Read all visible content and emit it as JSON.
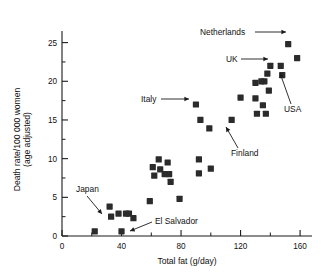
{
  "chart_data": {
    "type": "scatter",
    "title": "",
    "xlabel": "Total fat (g/day)",
    "ylabel_line1": "Death rate/100 000 women",
    "ylabel_line2": "(age adjusted)",
    "xlim": [
      0,
      168
    ],
    "ylim": [
      0,
      26.5
    ],
    "grid": false,
    "legend": "none",
    "xticks_major": [
      0,
      40,
      80,
      120,
      160
    ],
    "xticks_major_labels": [
      "0",
      "40",
      "80",
      "120",
      "160"
    ],
    "xticks_minor": [
      20,
      60,
      100,
      140
    ],
    "yticks_major": [
      0,
      5,
      10,
      15,
      20,
      25
    ],
    "yticks_major_labels": [
      "0",
      "5",
      "10",
      "15",
      "20",
      "25"
    ],
    "yticks_minor": [
      2.5,
      7.5,
      12.5,
      17.5,
      22.5
    ],
    "marker_shape": "square",
    "marker_color": "#2b2b2b",
    "points": [
      {
        "x": 22,
        "y": 0.6,
        "label": ""
      },
      {
        "x": 32,
        "y": 3.8,
        "label": ""
      },
      {
        "x": 33,
        "y": 2.5,
        "label": "Japan"
      },
      {
        "x": 38,
        "y": 2.9,
        "label": ""
      },
      {
        "x": 40,
        "y": 0.6,
        "label": "El Salvador"
      },
      {
        "x": 43,
        "y": 2.9,
        "label": ""
      },
      {
        "x": 45,
        "y": 2.9,
        "label": ""
      },
      {
        "x": 48,
        "y": 2.3,
        "label": ""
      },
      {
        "x": 59,
        "y": 4.5,
        "label": ""
      },
      {
        "x": 61,
        "y": 8.9,
        "label": ""
      },
      {
        "x": 62,
        "y": 7.8,
        "label": ""
      },
      {
        "x": 65,
        "y": 9.9,
        "label": ""
      },
      {
        "x": 66,
        "y": 8.6,
        "label": ""
      },
      {
        "x": 69,
        "y": 8.0,
        "label": ""
      },
      {
        "x": 71,
        "y": 9.5,
        "label": ""
      },
      {
        "x": 72,
        "y": 8.0,
        "label": ""
      },
      {
        "x": 73,
        "y": 7.0,
        "label": ""
      },
      {
        "x": 79,
        "y": 4.8,
        "label": ""
      },
      {
        "x": 90,
        "y": 17.0,
        "label": "Italy"
      },
      {
        "x": 92,
        "y": 9.9,
        "label": ""
      },
      {
        "x": 92,
        "y": 8.1,
        "label": ""
      },
      {
        "x": 93,
        "y": 15.0,
        "label": ""
      },
      {
        "x": 99,
        "y": 13.9,
        "label": ""
      },
      {
        "x": 100,
        "y": 8.7,
        "label": ""
      },
      {
        "x": 114,
        "y": 15.0,
        "label": "Finland"
      },
      {
        "x": 120,
        "y": 17.9,
        "label": ""
      },
      {
        "x": 130,
        "y": 19.8,
        "label": ""
      },
      {
        "x": 130,
        "y": 17.8,
        "label": ""
      },
      {
        "x": 131,
        "y": 15.8,
        "label": ""
      },
      {
        "x": 134,
        "y": 20.0,
        "label": ""
      },
      {
        "x": 135,
        "y": 16.9,
        "label": ""
      },
      {
        "x": 136,
        "y": 20.0,
        "label": ""
      },
      {
        "x": 137,
        "y": 15.8,
        "label": ""
      },
      {
        "x": 138,
        "y": 21.0,
        "label": ""
      },
      {
        "x": 139,
        "y": 18.8,
        "label": ""
      },
      {
        "x": 140,
        "y": 22.0,
        "label": "UK"
      },
      {
        "x": 147,
        "y": 22.0,
        "label": ""
      },
      {
        "x": 148,
        "y": 20.8,
        "label": "USA"
      },
      {
        "x": 152,
        "y": 24.8,
        "label": "Netherlands"
      },
      {
        "x": 158,
        "y": 23.0,
        "label": ""
      }
    ],
    "annotations": [
      {
        "name": "netherlands",
        "text": "Netherlands",
        "text_x": 200,
        "text_y": 35,
        "line_from_x": 255,
        "line_from_y": 32,
        "line_to_x": 286,
        "line_to_y": 32
      },
      {
        "name": "uk",
        "text": "UK",
        "text_x": 226,
        "text_y": 62,
        "line_from_x": 241,
        "line_from_y": 59,
        "line_to_x": 268,
        "line_to_y": 59
      },
      {
        "name": "usa",
        "text": "USA",
        "text_x": 284,
        "text_y": 112,
        "line_from_x": 291,
        "line_from_y": 104,
        "line_to_x": 280,
        "line_to_y": 73
      },
      {
        "name": "italy",
        "text": "Italy",
        "text_x": 141,
        "text_y": 102,
        "line_from_x": 161,
        "line_from_y": 99,
        "line_to_x": 189,
        "line_to_y": 99
      },
      {
        "name": "finland",
        "text": "Finland",
        "text_x": 231,
        "text_y": 156,
        "line_from_x": 238,
        "line_from_y": 148,
        "line_to_x": 226,
        "line_to_y": 127
      },
      {
        "name": "japan",
        "text": "Japan",
        "text_x": 76,
        "text_y": 192,
        "line_from_x": 87,
        "line_from_y": 196,
        "line_to_x": 102,
        "line_to_y": 214
      },
      {
        "name": "el-salvador",
        "text": "El Salvador",
        "text_x": 155,
        "text_y": 224,
        "line_from_x": 152,
        "line_from_y": 222,
        "line_to_x": 130,
        "line_to_y": 231
      }
    ]
  }
}
